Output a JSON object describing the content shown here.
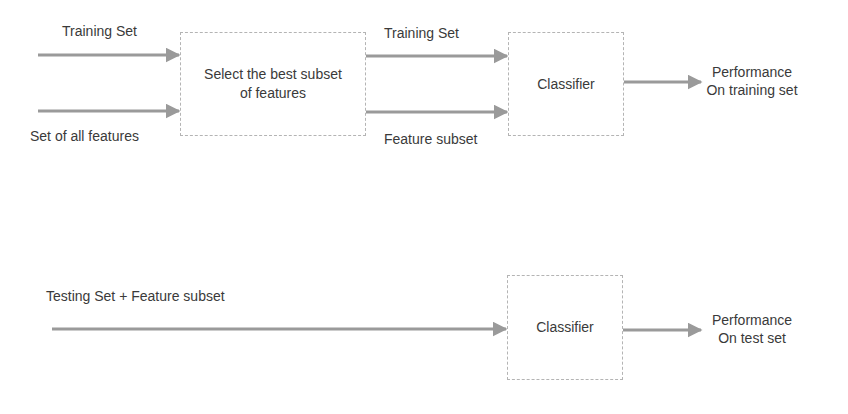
{
  "diagram": {
    "training_phase": {
      "inputs": {
        "training_set": "Training Set",
        "all_features": "Set of all features"
      },
      "selector_box": {
        "line1": "Select the best subset",
        "line2": "of features"
      },
      "intermediate": {
        "training_set": "Training Set",
        "feature_subset": "Feature subset"
      },
      "classifier_box": "Classifier",
      "output": {
        "line1": "Performance",
        "line2": "On training set"
      }
    },
    "testing_phase": {
      "input": "Testing Set + Feature subset",
      "classifier_box": "Classifier",
      "output": {
        "line1": "Performance",
        "line2": "On test set"
      }
    }
  },
  "colors": {
    "arrow": "#9a9a9a",
    "box_border": "#b4b4b4",
    "text": "#3a3a3a"
  }
}
